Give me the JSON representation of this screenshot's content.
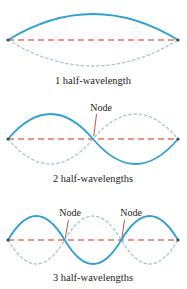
{
  "figure": {
    "panels": [
      {
        "label": "1 half-wavelength",
        "node_labels": []
      },
      {
        "label": "2 half-wavelengths",
        "node_labels": [
          "Node"
        ]
      },
      {
        "label": "3 half-wavelengths",
        "node_labels": [
          "Node",
          "Node"
        ]
      }
    ]
  },
  "colors": {
    "wave_solid": "#31a0d2",
    "wave_mirror": "#a5c6d6",
    "axis_dashed": "#e2755a",
    "leader_line": "#b15a43",
    "endpoint_dot": "#3c4c58",
    "text": "#232323",
    "background": "#ffffff"
  }
}
